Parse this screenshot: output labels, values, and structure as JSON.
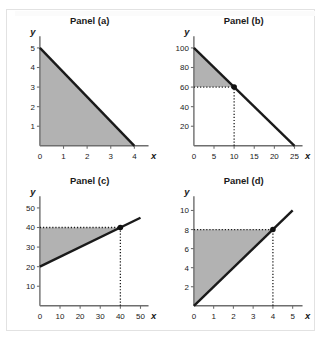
{
  "figure": {
    "panel_count": 4,
    "background_color": "#ffffff",
    "frame_color": "#e2e2e2",
    "shade_color": "#b2b2b2",
    "line_color": "#1a1a1a",
    "axis_color": "#6e6e6e"
  },
  "chart_data": [
    {
      "type": "line",
      "title": "Panel (a)",
      "xlabel": "x",
      "ylabel": "y",
      "xlim": [
        0,
        4.6
      ],
      "ylim": [
        0,
        5.6
      ],
      "xticks": [
        0,
        1,
        2,
        3,
        4
      ],
      "xtick_labels": [
        "0",
        "1",
        "2",
        "3",
        "4"
      ],
      "yticks": [
        1,
        2,
        3,
        4,
        5
      ],
      "ytick_labels": [
        "1",
        "2",
        "3",
        "4",
        "5"
      ],
      "grid": false,
      "legend": "none",
      "series": [
        {
          "name": "line",
          "x": [
            0,
            4
          ],
          "y": [
            5,
            0
          ]
        }
      ],
      "shaded_region": {
        "description": "triangle under line",
        "points": [
          [
            0,
            0
          ],
          [
            0,
            5
          ],
          [
            4,
            0
          ]
        ]
      },
      "markers": [],
      "guides": []
    },
    {
      "type": "line",
      "title": "Panel (b)",
      "xlabel": "x",
      "ylabel": "y",
      "xlim": [
        0,
        27
      ],
      "ylim": [
        0,
        112
      ],
      "xticks": [
        0,
        5,
        10,
        15,
        20,
        25
      ],
      "xtick_labels": [
        "0",
        "5",
        "10",
        "15",
        "20",
        "25"
      ],
      "yticks": [
        20,
        40,
        60,
        80,
        100
      ],
      "ytick_labels": [
        "20",
        "40",
        "60",
        "80",
        "100"
      ],
      "grid": false,
      "legend": "none",
      "series": [
        {
          "name": "line",
          "x": [
            0,
            25
          ],
          "y": [
            100,
            0
          ]
        }
      ],
      "shaded_region": {
        "description": "triangle above guide line y=60",
        "points": [
          [
            0,
            60
          ],
          [
            0,
            100
          ],
          [
            10,
            60
          ]
        ]
      },
      "markers": [
        {
          "x": 10,
          "y": 60
        }
      ],
      "guides": [
        {
          "orientation": "horizontal",
          "value": 60,
          "from": 0,
          "to": 10
        },
        {
          "orientation": "vertical",
          "value": 10,
          "from": 0,
          "to": 60
        }
      ]
    },
    {
      "type": "line",
      "title": "Panel (c)",
      "xlabel": "x",
      "ylabel": "y",
      "xlim": [
        0,
        54
      ],
      "ylim": [
        0,
        56
      ],
      "xticks": [
        0,
        10,
        20,
        30,
        40,
        50
      ],
      "xtick_labels": [
        "0",
        "10",
        "20",
        "30",
        "40",
        "50"
      ],
      "yticks": [
        10,
        20,
        30,
        40,
        50
      ],
      "ytick_labels": [
        "10",
        "20",
        "30",
        "40",
        "50"
      ],
      "grid": false,
      "legend": "none",
      "series": [
        {
          "name": "line",
          "x": [
            0,
            50
          ],
          "y": [
            20,
            45
          ]
        }
      ],
      "shaded_region": {
        "description": "triangle between line and guide line y=40",
        "points": [
          [
            0,
            20
          ],
          [
            0,
            40
          ],
          [
            40,
            40
          ]
        ]
      },
      "markers": [
        {
          "x": 40,
          "y": 40
        }
      ],
      "guides": [
        {
          "orientation": "horizontal",
          "value": 40,
          "from": 0,
          "to": 40
        },
        {
          "orientation": "vertical",
          "value": 40,
          "from": 0,
          "to": 40
        }
      ]
    },
    {
      "type": "line",
      "title": "Panel (d)",
      "xlabel": "x",
      "ylabel": "y",
      "xlim": [
        0,
        5.5
      ],
      "ylim": [
        0,
        11.5
      ],
      "xticks": [
        0,
        1,
        2,
        3,
        4,
        5
      ],
      "xtick_labels": [
        "0",
        "1",
        "2",
        "3",
        "4",
        "5"
      ],
      "yticks": [
        2,
        4,
        6,
        8,
        10
      ],
      "ytick_labels": [
        "2",
        "4",
        "6",
        "8",
        "10"
      ],
      "grid": false,
      "legend": "none",
      "series": [
        {
          "name": "line",
          "x": [
            0,
            5
          ],
          "y": [
            0,
            10
          ]
        }
      ],
      "shaded_region": {
        "description": "triangle between line and guide line y=8",
        "points": [
          [
            0,
            0
          ],
          [
            0,
            8
          ],
          [
            4,
            8
          ]
        ]
      },
      "markers": [
        {
          "x": 4,
          "y": 8
        }
      ],
      "guides": [
        {
          "orientation": "horizontal",
          "value": 8,
          "from": 0,
          "to": 4
        },
        {
          "orientation": "vertical",
          "value": 4,
          "from": 0,
          "to": 8
        }
      ]
    }
  ]
}
